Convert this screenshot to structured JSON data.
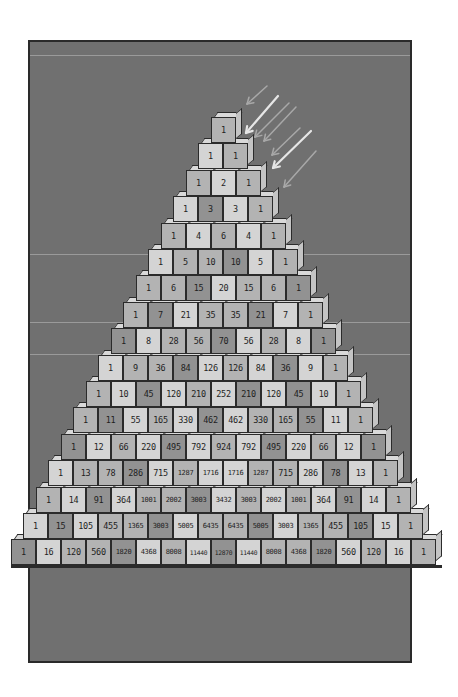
{
  "illustration": {
    "title": "Pascal's triangle built from cubes",
    "colors": {
      "panel": "#707070",
      "panel_border": "#2a2a2a",
      "cube_light": "#d4d4d4",
      "cube_medium": "#b3b3b3",
      "cube_dark": "#929292",
      "arrow_bright": "#e6e6e6",
      "arrow_faint": "#a8a8a8"
    },
    "layout": {
      "center_x": 223,
      "top_row_y": 117,
      "row_step": 26.4,
      "cube_width": 25,
      "cube_height": 26
    },
    "rows": [
      {
        "values": [
          1
        ],
        "shades": "M"
      },
      {
        "values": [
          1,
          1
        ],
        "shades": "LM"
      },
      {
        "values": [
          1,
          2,
          1
        ],
        "shades": "MLM"
      },
      {
        "values": [
          1,
          3,
          3,
          1
        ],
        "shades": "LDLM"
      },
      {
        "values": [
          1,
          4,
          6,
          4,
          1
        ],
        "shades": "MLMLM"
      },
      {
        "values": [
          1,
          5,
          10,
          10,
          5,
          1
        ],
        "shades": "LMMDLM"
      },
      {
        "values": [
          1,
          6,
          15,
          20,
          15,
          6,
          1
        ],
        "shades": "MMDLMMD"
      },
      {
        "values": [
          1,
          7,
          21,
          35,
          35,
          21,
          7,
          1
        ],
        "shades": "MDLMMDLM"
      },
      {
        "values": [
          1,
          8,
          28,
          56,
          70,
          56,
          28,
          8,
          1
        ],
        "shades": "DLMMDLMLD"
      },
      {
        "values": [
          1,
          9,
          36,
          84,
          126,
          126,
          84,
          36,
          9,
          1
        ],
        "shades": "LMMDLMLDLM"
      },
      {
        "values": [
          1,
          10,
          45,
          120,
          210,
          252,
          210,
          120,
          45,
          10,
          1
        ],
        "shades": "MLDLMLDLDLM"
      },
      {
        "values": [
          1,
          11,
          55,
          165,
          330,
          462,
          462,
          330,
          165,
          55,
          11,
          1
        ],
        "shades": "MDLMLDLMMDLM"
      },
      {
        "values": [
          1,
          12,
          66,
          220,
          495,
          792,
          924,
          792,
          495,
          220,
          66,
          12,
          1
        ],
        "shades": "DLMLDLMLDLMLD"
      },
      {
        "values": [
          1,
          13,
          78,
          286,
          715,
          1287,
          1716,
          1716,
          1287,
          715,
          286,
          78,
          13,
          1
        ],
        "shades": "LMMDLMLLMMLDLM"
      },
      {
        "values": [
          1,
          14,
          91,
          364,
          1001,
          2002,
          3003,
          3432,
          3003,
          2002,
          1001,
          364,
          91,
          14,
          1
        ],
        "shades": "MLDLMMDLMLMLDLM"
      },
      {
        "values": [
          1,
          15,
          105,
          455,
          1365,
          3003,
          5005,
          6435,
          6435,
          5005,
          3003,
          1365,
          455,
          105,
          15,
          1
        ],
        "shades": "LDLMMDLMMDLMMDLM"
      },
      {
        "values": [
          1,
          16,
          120,
          560,
          1820,
          4368,
          8008,
          11440,
          12870,
          11440,
          8008,
          4368,
          1820,
          560,
          120,
          16,
          1
        ],
        "shades": "DLMMDLMLDLMMDLMLM"
      }
    ],
    "arrows": [
      {
        "x1": 267,
        "y1": 86,
        "x2": 247,
        "y2": 104,
        "style": "faint"
      },
      {
        "x1": 278,
        "y1": 96,
        "x2": 246,
        "y2": 133,
        "style": "bright"
      },
      {
        "x1": 289,
        "y1": 103,
        "x2": 255,
        "y2": 137,
        "style": "faint"
      },
      {
        "x1": 296,
        "y1": 107,
        "x2": 264,
        "y2": 141,
        "style": "faint"
      },
      {
        "x1": 300,
        "y1": 128,
        "x2": 272,
        "y2": 155,
        "style": "faint"
      },
      {
        "x1": 311,
        "y1": 131,
        "x2": 273,
        "y2": 168,
        "style": "bright"
      },
      {
        "x1": 316,
        "y1": 151,
        "x2": 284,
        "y2": 187,
        "style": "faint"
      }
    ],
    "background_lines_y": [
      55,
      254,
      322,
      354
    ]
  }
}
